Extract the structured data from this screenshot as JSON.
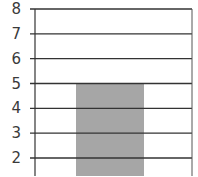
{
  "chart_data": {
    "type": "bar",
    "title": "",
    "xlabel": "",
    "ylabel": "",
    "categories": [
      ""
    ],
    "values": [
      5
    ],
    "ylim": [
      1.1,
      8
    ],
    "yticks": [
      2,
      3,
      4,
      5,
      6,
      7,
      8
    ],
    "ytick_labels": [
      "2",
      "3",
      "4",
      "5",
      "6",
      "7",
      "8"
    ],
    "grid": true,
    "legend": null,
    "bar_color": "#a6a6a6",
    "note": "Cropped view; bar extends below visible area, top at 5"
  },
  "colors": {
    "bar": "#a6a6a6",
    "gridline": "#333333",
    "axis": "#333333",
    "label": "#3a3a3a",
    "background": "#ffffff"
  }
}
